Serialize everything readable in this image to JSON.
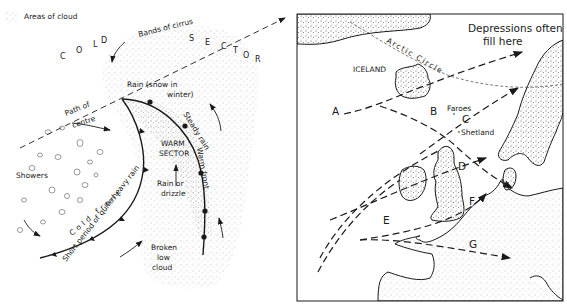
{
  "legend": {
    "swatch_icon": "stipple-swatch",
    "label": "Areas of cloud"
  },
  "left_diagram": {
    "title_hint": "Depression (frontal system) cross-section plan",
    "cold_sector_letters": [
      "C",
      "O",
      "L",
      "D",
      "S",
      "E",
      "C",
      "T",
      "O",
      "R"
    ],
    "labels": {
      "bands_of_cirrus": "Bands of cirrus",
      "rain_snow_1": "Rain (snow in",
      "rain_snow_2": "winter)",
      "path_of_centre_1": "Path of",
      "path_of_centre_2": "centre",
      "warm_sector_1": "WARM",
      "warm_sector_2": "SECTOR",
      "steady_rain": "Steady rain",
      "warm_front": "Warm front",
      "rain_or_drizzle_1": "Rain or",
      "rain_or_drizzle_2": "drizzle",
      "showers": "Showers",
      "cold_front": "Cold front",
      "short_period": "Short period of quite heavy rain",
      "broken_low_cloud_1": "Broken",
      "broken_low_cloud_2": "low",
      "broken_low_cloud_3": "cloud"
    }
  },
  "right_map": {
    "labels": {
      "depressions_1": "Depressions often",
      "depressions_2": "fill here",
      "arctic_circle": "Arctic Circle",
      "iceland": "ICELAND",
      "faroes": "Faroes",
      "shetland": "Shetland"
    },
    "tracks": [
      "A",
      "B",
      "C",
      "D",
      "E",
      "F",
      "G"
    ]
  },
  "colors": {
    "ink": "#1a1a1a",
    "stipple": "#8a8a8a",
    "background": "#ffffff"
  }
}
